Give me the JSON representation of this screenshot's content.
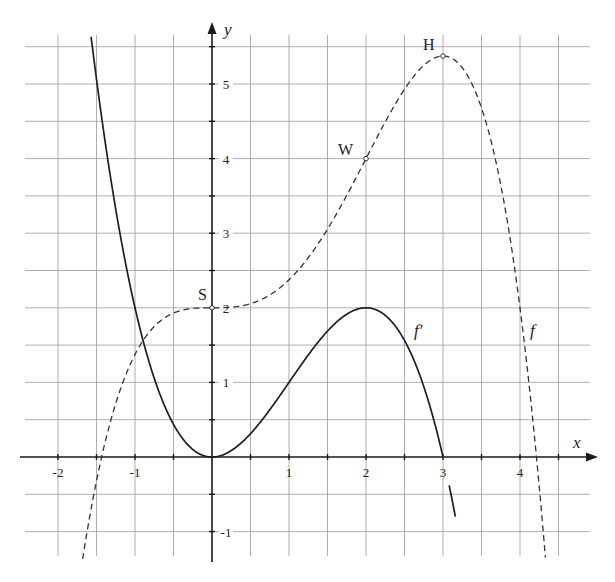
{
  "chart_data": {
    "type": "line",
    "title": "",
    "xlabel": "x",
    "ylabel": "y",
    "xlim": [
      -2.5,
      4.85
    ],
    "ylim": [
      -1.45,
      5.8
    ],
    "grid": true,
    "grid_step": 0.5,
    "x_ticks": [
      -2,
      -1,
      1,
      2,
      3,
      4
    ],
    "x_tick_labels": [
      "-2",
      "-1",
      "1",
      "2",
      "3",
      "4"
    ],
    "y_ticks": [
      -1,
      1,
      2,
      3,
      4,
      5
    ],
    "y_tick_labels": [
      "-1",
      "1",
      "2",
      "3",
      "4",
      "5"
    ],
    "series": [
      {
        "name": "f'",
        "label": "f′",
        "style": "solid",
        "formula": "0.5*x^2*(3-x)",
        "x": [
          -1.6,
          -1.5,
          -1,
          -0.5,
          0,
          0.5,
          1,
          1.5,
          2,
          2.5,
          3,
          3.25
        ],
        "values": [
          5.65,
          5.06,
          2.0,
          0.44,
          0,
          0.31,
          1.0,
          1.69,
          2.0,
          1.56,
          0,
          -0.79
        ]
      },
      {
        "name": "f",
        "label": "f",
        "style": "dashed",
        "formula": "x^3/2 - x^4/8 + 2",
        "x": [
          -1.7,
          -1.5,
          -1,
          -0.5,
          0,
          0.5,
          1,
          1.5,
          2,
          2.5,
          3,
          3.5,
          4,
          4.3
        ],
        "values": [
          -2.0,
          -0.32,
          1.38,
          1.93,
          2.0,
          2.05,
          2.38,
          3.05,
          4.0,
          4.93,
          5.38,
          4.68,
          2.0,
          -0.53
        ]
      }
    ],
    "points": [
      {
        "label": "S",
        "x": 0,
        "y": 2
      },
      {
        "label": "W",
        "x": 2,
        "y": 4
      },
      {
        "label": "H",
        "x": 3,
        "y": 5.375
      }
    ]
  }
}
